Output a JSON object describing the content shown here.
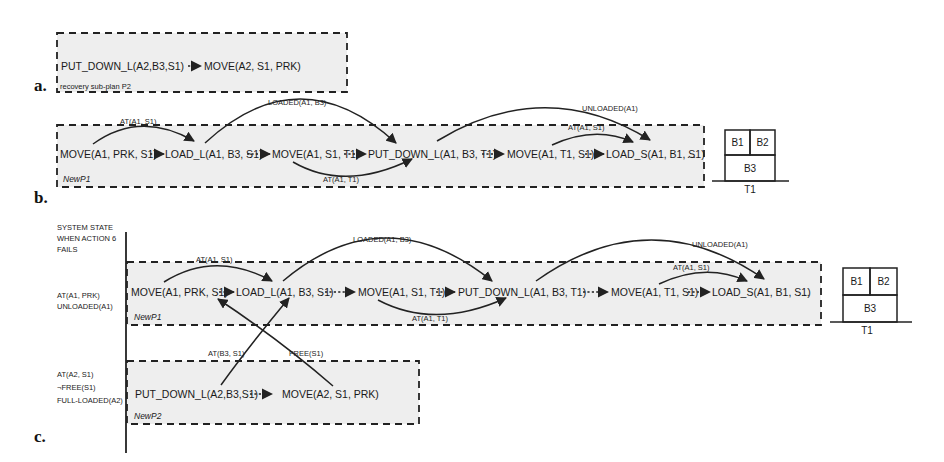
{
  "panels": {
    "a": {
      "label": "a.",
      "actions": [
        "PUT_DOWN_L(A2,B3,S1)",
        "MOVE(A2, S1, PRK)"
      ],
      "plan_name": "recovery sub-plan P2"
    },
    "b": {
      "label": "b.",
      "plan_name": "NewP1",
      "actions": [
        "MOVE(A1, PRK, S1)",
        "LOAD_L(A1, B3, S1)",
        "MOVE(A1, S1, T1)",
        "PUT_DOWN_L(A1, B3, T1)",
        "MOVE(A1, T1, S1)",
        "LOAD_S(A1, B1, S1)"
      ],
      "trailing": "...",
      "links": [
        "AT(A1, S1)",
        "LOADED(A1, B3)",
        "AT(A1, T1)",
        "UNLOADED(A1)",
        "AT(A1, S1)"
      ],
      "blocks": {
        "top_left": "B1",
        "top_right": "B2",
        "bottom": "B3",
        "table": "T1"
      }
    },
    "c": {
      "label": "c.",
      "state_header": [
        "SYSTEM STATE",
        "WHEN ACTION 6",
        "FAILS"
      ],
      "state_p1": [
        "AT(A1, PRK)",
        "UNLOADED(A1)"
      ],
      "state_p2": [
        "AT(A2, S1)",
        "¬FREE(S1)",
        "FULL-LOADED(A2)"
      ],
      "p1": {
        "plan_name": "NewP1",
        "actions": [
          "MOVE(A1, PRK, S1)",
          "LOAD_L(A1, B3, S1)",
          "MOVE(A1, S1, T1)",
          "PUT_DOWN_L(A1, B3, T1)",
          "MOVE(A1, T1, S1)",
          "LOAD_S(A1, B1, S1)"
        ],
        "trailing": "...",
        "links": [
          "AT(A1, S1)",
          "LOADED(A1, B3)",
          "AT(A1, T1)",
          "UNLOADED(A1)",
          "AT(A1, S1)"
        ]
      },
      "p2": {
        "plan_name": "NewP2",
        "actions": [
          "PUT_DOWN_L(A2,B3,S1)",
          "MOVE(A2, S1, PRK)"
        ]
      },
      "cross_links": [
        "AT(B3, S1)",
        "FREE(S1)"
      ],
      "blocks": {
        "top_left": "B1",
        "top_right": "B2",
        "bottom": "B3",
        "table": "T1"
      }
    }
  }
}
